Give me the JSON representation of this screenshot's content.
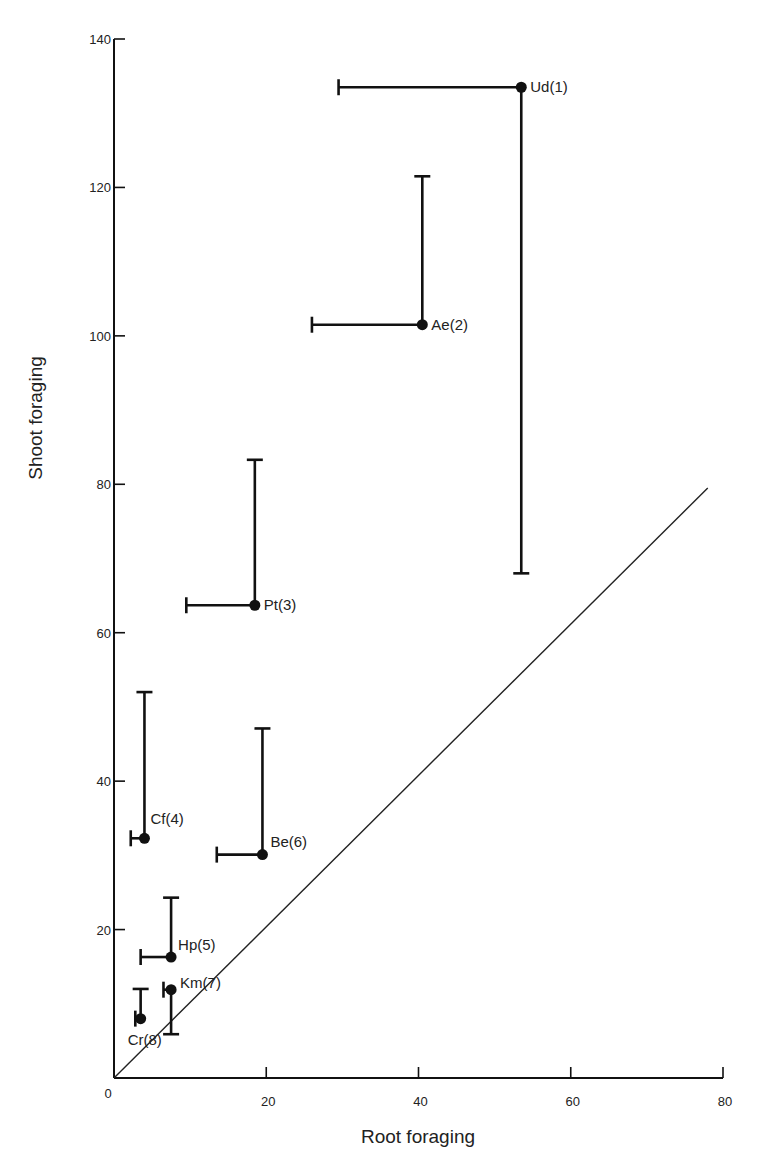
{
  "chart_data": {
    "type": "scatter",
    "title": "",
    "xlabel": "Root foraging",
    "ylabel": "Shoot foraging",
    "xlim": [
      0,
      80
    ],
    "ylim": [
      0,
      140
    ],
    "xticks": [
      0,
      20,
      40,
      60,
      80
    ],
    "yticks": [
      20,
      40,
      60,
      80,
      100,
      120,
      140
    ],
    "origin_label": "0",
    "grid": false,
    "legend": null,
    "reference_line": {
      "description": "1:1 line",
      "from": [
        0,
        0
      ],
      "to": [
        78,
        79.5
      ]
    },
    "points": [
      {
        "label": "Ud(1)",
        "x": 53.5,
        "y": 133.5,
        "x_err_low": 29.5,
        "y_err_low": 68
      },
      {
        "label": "Ae(2)",
        "x": 40.5,
        "y": 101.5,
        "x_err_low": 26,
        "y_err_high": 121.5
      },
      {
        "label": "Pt(3)",
        "x": 18.5,
        "y": 63.7,
        "x_err_low": 9.5,
        "y_err_high": 83.3
      },
      {
        "label": "Cf(4)",
        "x": 4,
        "y": 32.3,
        "x_err_low": 2.2,
        "y_err_high": 52
      },
      {
        "label": "Hp(5)",
        "x": 7.5,
        "y": 16.3,
        "x_err_low": 3.5,
        "y_err_high": 24.3
      },
      {
        "label": "Be(6)",
        "x": 19.5,
        "y": 30.1,
        "x_err_low": 13.5,
        "y_err_high": 47.1
      },
      {
        "label": "Km(7)",
        "x": 7.5,
        "y": 11.9,
        "x_err_low": 6.5,
        "y_err_low": 5.9
      },
      {
        "label": "Cr(8)",
        "x": 3.5,
        "y": 8,
        "x_err_low": 2.8,
        "y_err_high": 12
      }
    ]
  }
}
